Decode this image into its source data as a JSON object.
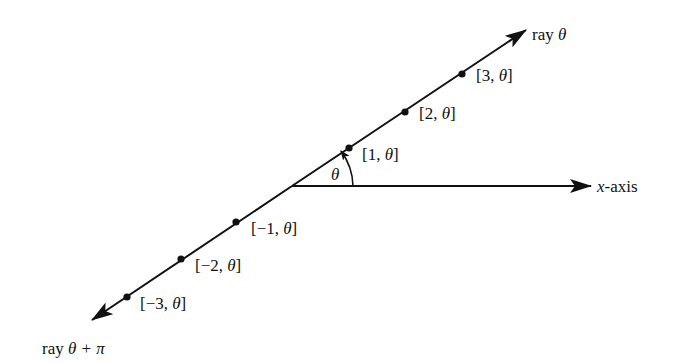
{
  "diagram": {
    "colors": {
      "ink": "#111111",
      "background": "#ffffff"
    },
    "origin": {
      "x": 292,
      "y": 186
    },
    "rays": {
      "upper": {
        "label": "ray θ",
        "label_prefix": "ray ",
        "label_symbol": "θ"
      },
      "lower": {
        "label": "ray θ + π",
        "label_prefix": "ray ",
        "label_symbol": "θ + π"
      }
    },
    "x_axis": {
      "label": "x-axis",
      "label_var": "x",
      "label_rest": "-axis"
    },
    "angle": {
      "label": "θ"
    },
    "points": [
      {
        "r": 3,
        "label": "[3, θ]",
        "label_num": "[3, ",
        "label_theta": "θ",
        "label_close": "]"
      },
      {
        "r": 2,
        "label": "[2, θ]",
        "label_num": "[2, ",
        "label_theta": "θ",
        "label_close": "]"
      },
      {
        "r": 1,
        "label": "[1, θ]",
        "label_num": "[1, ",
        "label_theta": "θ",
        "label_close": "]"
      },
      {
        "r": -1,
        "label": "[−1, θ]",
        "label_num": "[−1, ",
        "label_theta": "θ",
        "label_close": "]"
      },
      {
        "r": -2,
        "label": "[−2, θ]",
        "label_num": "[−2, ",
        "label_theta": "θ",
        "label_close": "]"
      },
      {
        "r": -3,
        "label": "[−3, θ]",
        "label_num": "[−3, ",
        "label_theta": "θ",
        "label_close": "]"
      }
    ]
  }
}
